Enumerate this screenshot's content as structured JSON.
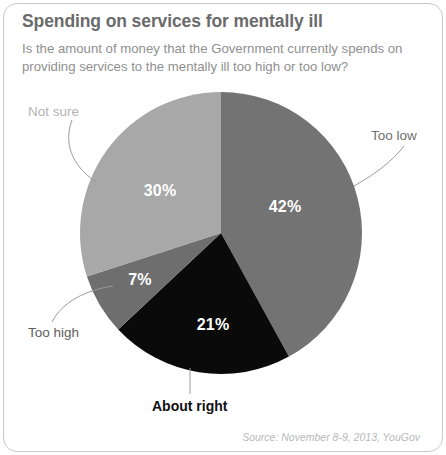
{
  "card": {
    "title": "Spending on services for mentally ill",
    "subtitle": "Is the amount of money that the Government currently spends on providing services to the mentally ill too high or too low?",
    "source": "Source: November 8-9, 2013, YouGov"
  },
  "colors": {
    "too_low": "#737373",
    "about_right": "#0a0a0a",
    "too_high": "#6e6e6e",
    "not_sure": "#a8a8a8",
    "title_text": "#6b6b6b",
    "subtitle_text": "#8f8f8f",
    "source_text": "#b9b9b9",
    "frame_border": "#c9c9c9",
    "leader_line": "#9a9a9a",
    "value_text": "#ffffff"
  },
  "chart_data": {
    "type": "pie",
    "title": "Spending on services for mentally ill",
    "subtitle": "Is the amount of money that the Government currently spends on providing services to the mentally ill too high or too low?",
    "categories": [
      "Too low",
      "About right",
      "Too high",
      "Not sure"
    ],
    "values": [
      42,
      21,
      7,
      30
    ],
    "value_labels": [
      "42%",
      "21%",
      "7%",
      "30%"
    ],
    "unit": "percent",
    "total": 100,
    "start_angle_deg": 0,
    "direction": "clockwise",
    "legend": "none",
    "grid": false,
    "slice_colors": [
      "#737373",
      "#0a0a0a",
      "#6e6e6e",
      "#a8a8a8"
    ],
    "label_placement": "callout-leader-lines",
    "slices": [
      {
        "name": "Too low",
        "value": 42,
        "value_label": "42%",
        "color": "#737373",
        "label_color": "#6f6f6f",
        "start_deg": 0,
        "end_deg": 151.2
      },
      {
        "name": "About right",
        "value": 21,
        "value_label": "21%",
        "color": "#0a0a0a",
        "label_color": "#111111",
        "start_deg": 151.2,
        "end_deg": 226.8
      },
      {
        "name": "Too high",
        "value": 7,
        "value_label": "7%",
        "color": "#6e6e6e",
        "label_color": "#5e5e5e",
        "start_deg": 226.8,
        "end_deg": 252.0
      },
      {
        "name": "Not sure",
        "value": 30,
        "value_label": "30%",
        "color": "#a8a8a8",
        "label_color": "#b4b4b4",
        "start_deg": 252.0,
        "end_deg": 360.0
      }
    ]
  }
}
